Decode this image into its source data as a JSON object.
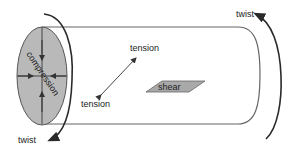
{
  "diagram": {
    "labels": {
      "twist_top": "twist",
      "twist_bottom": "twist",
      "tension_top": "tension",
      "tension_bottom": "tension",
      "shear": "shear",
      "compression": "compression"
    },
    "colors": {
      "stroke": "#4a4a4a",
      "arc": "#2a2a2a",
      "ellipse_fill": "#b9b9b9",
      "shear_fill": "#a9a9a9",
      "text": "#222222",
      "background": "#ffffff"
    }
  }
}
